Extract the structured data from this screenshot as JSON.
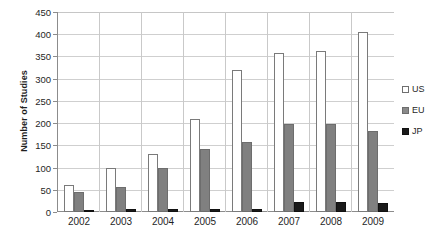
{
  "chart_data": {
    "type": "bar",
    "title": "",
    "xlabel": "",
    "ylabel": "Number of Studies",
    "categories": [
      "2002",
      "2003",
      "2004",
      "2005",
      "2006",
      "2007",
      "2008",
      "2009"
    ],
    "series": [
      {
        "name": "US",
        "values": [
          60,
          100,
          130,
          210,
          320,
          357,
          362,
          405
        ],
        "color": "#ffffff"
      },
      {
        "name": "EU",
        "values": [
          45,
          56,
          100,
          142,
          157,
          198,
          197,
          183
        ],
        "color": "#808080"
      },
      {
        "name": "JP",
        "values": [
          5,
          7,
          7,
          7,
          6,
          22,
          22,
          20
        ],
        "color": "#1a1a1a"
      }
    ],
    "ylim": [
      0,
      450
    ],
    "ytick_step": 50,
    "yticks": [
      "450",
      "400",
      "350",
      "300",
      "250",
      "200",
      "150",
      "100",
      "50",
      "0"
    ],
    "grid": true,
    "legend_position": "right"
  },
  "legend": {
    "items": [
      {
        "label": "US"
      },
      {
        "label": "EU"
      },
      {
        "label": "JP"
      }
    ]
  }
}
